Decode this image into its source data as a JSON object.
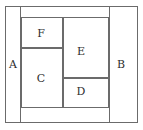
{
  "figure": {
    "type": "partition-diagram",
    "canvas": {
      "width": 143,
      "height": 130,
      "background": "#ffffff"
    },
    "stroke_color": "#6b6b6b",
    "text_color": "#2e2e2e"
  },
  "outer": {
    "name": "outer-boundary",
    "x": 5,
    "y": 6,
    "width": 133,
    "height": 117
  },
  "regions": [
    {
      "id": "A",
      "label": "A",
      "x": 5,
      "y": 6,
      "width": 16,
      "height": 117,
      "label_x": 13,
      "label_y": 65
    },
    {
      "id": "B",
      "label": "B",
      "x": 109,
      "y": 6,
      "width": 29,
      "height": 117,
      "label_x": 121,
      "label_y": 65
    },
    {
      "id": "F",
      "label": "F",
      "x": 21,
      "y": 17,
      "width": 42,
      "height": 31,
      "label_x": 41,
      "label_y": 34
    },
    {
      "id": "C",
      "label": "C",
      "x": 21,
      "y": 48,
      "width": 42,
      "height": 60,
      "label_x": 41,
      "label_y": 79
    },
    {
      "id": "E",
      "label": "E",
      "x": 63,
      "y": 17,
      "width": 46,
      "height": 61,
      "label_x": 81,
      "label_y": 52
    },
    {
      "id": "D",
      "label": "D",
      "x": 63,
      "y": 78,
      "width": 46,
      "height": 30,
      "label_x": 81,
      "label_y": 92
    }
  ]
}
